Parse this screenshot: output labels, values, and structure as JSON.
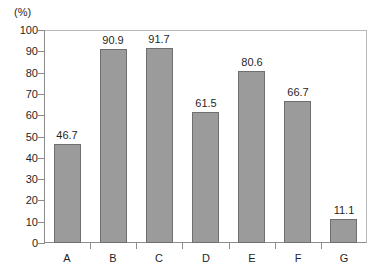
{
  "chart_data": {
    "type": "bar",
    "title": "",
    "subtitle": "",
    "xlabel": "",
    "ylabel": "",
    "unit_label": "(%)",
    "categories": [
      "A",
      "B",
      "C",
      "D",
      "E",
      "F",
      "G"
    ],
    "values": [
      46.7,
      90.9,
      91.7,
      61.5,
      80.6,
      66.7,
      11.1
    ],
    "value_labels": [
      "46.7",
      "90.9",
      "91.7",
      "61.5",
      "80.6",
      "66.7",
      "11.1"
    ],
    "ylim": [
      0,
      100
    ],
    "ytick_values": [
      0,
      10,
      20,
      30,
      40,
      50,
      60,
      70,
      80,
      90,
      100
    ],
    "ytick_labels": [
      "0",
      "10",
      "20",
      "30",
      "40",
      "50",
      "60",
      "70",
      "80",
      "90",
      "100"
    ],
    "grid": false,
    "legend": null,
    "legend_position": "none",
    "bar_color": "#9b9b9b",
    "bar_edge_color": "#6f6f6f",
    "frame_color": "#b9b9b9",
    "axis_color": "#8d8d8d",
    "text_color": "#1f1f1f",
    "background_color": "#ffffff"
  }
}
